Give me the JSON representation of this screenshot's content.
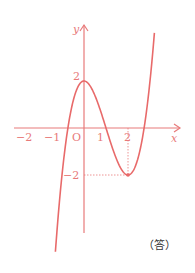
{
  "chart_data": {
    "type": "line",
    "title": "",
    "function": "y = x^3 - 3x^2 + 2",
    "xlabel": "x",
    "ylabel": "y",
    "origin_label": "O",
    "x_ticks": [
      "-2",
      "-1",
      "1",
      "2"
    ],
    "y_ticks": [
      "2",
      "-2"
    ],
    "xlim": [
      -2.6,
      4.3
    ],
    "ylim": [
      -4.6,
      4.4
    ],
    "grid": false,
    "key_points": [
      {
        "name": "local-max",
        "x": 0,
        "y": 2
      },
      {
        "name": "local-min",
        "x": 2,
        "y": -2
      }
    ],
    "roots": [
      -0.73,
      1,
      2.73
    ],
    "series": [
      {
        "name": "curve",
        "x": [
          -1.3,
          -1.0,
          -0.73,
          -0.5,
          0,
          0.5,
          1,
          1.5,
          2,
          2.5,
          2.73,
          3.0,
          3.2
        ],
        "y": [
          -4.27,
          -2.0,
          0.0,
          1.13,
          2.0,
          1.38,
          0.0,
          -1.38,
          -2.0,
          -1.13,
          0.0,
          2.0,
          3.99
        ]
      }
    ],
    "color": "#e86a6a"
  },
  "labels": {
    "x_axis": "x",
    "y_axis": "y",
    "origin": "O",
    "tick_neg2": "−2",
    "tick_neg1": "−1",
    "tick_1": "1",
    "tick_2": "2",
    "ytick_2": "2",
    "ytick_neg2": "−2",
    "answer": "（答）"
  }
}
